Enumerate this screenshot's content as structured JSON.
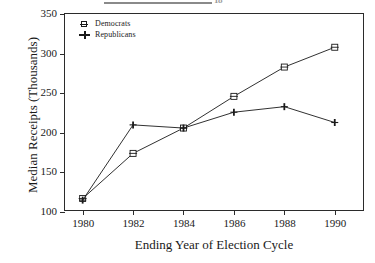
{
  "page_header": {
    "rule": "horizontal-rule",
    "fragment_text": "18"
  },
  "chart_data": {
    "type": "line",
    "title": "",
    "xlabel": "Ending Year of Election Cycle",
    "ylabel": "Median Receipts (Thousands)",
    "categories": [
      1980,
      1982,
      1984,
      1986,
      1988,
      1990
    ],
    "x": [
      1980,
      1982,
      1984,
      1986,
      1988,
      1990
    ],
    "xticklabels": [
      "1980",
      "1982",
      "1984",
      "1986",
      "1988",
      "1990"
    ],
    "yticklabels": [
      "100",
      "150",
      "200",
      "250",
      "300",
      "350"
    ],
    "yticks": [
      100,
      150,
      200,
      250,
      300,
      350
    ],
    "xlim": [
      1979.3,
      1991.2
    ],
    "ylim": [
      100,
      350
    ],
    "grid": false,
    "legend_position": "top-left",
    "series": [
      {
        "name": "Democrats",
        "marker": "square",
        "values": [
          117,
          174,
          206,
          246,
          283,
          308
        ]
      },
      {
        "name": "Republicans",
        "marker": "plus",
        "values": [
          115,
          210,
          206,
          226,
          233,
          213
        ]
      }
    ]
  },
  "colors": {
    "line": "#1a1a1a",
    "frame": "#2b2b2b",
    "background": "#ffffff"
  }
}
